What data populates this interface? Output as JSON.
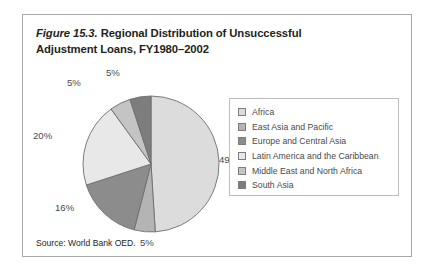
{
  "figure": {
    "number": "Figure 15.3.",
    "caption": " Regional Distribution of Unsuccessful Adjustment Loans, FY1980–2002",
    "full_title": "Figure 15.3. Regional Distribution of Unsuccessful Adjustment Loans, FY1980–2002",
    "source": "Source: World Bank OED."
  },
  "chart_data": {
    "type": "pie",
    "title": "Figure 15.3. Regional Distribution of Unsuccessful Adjustment Loans, FY1980–2002",
    "xlabel": "",
    "ylabel": "",
    "grid": false,
    "legend_position": "right",
    "start_angle_deg": 0,
    "direction": "clockwise",
    "units": "percent",
    "categories": [
      "Africa",
      "East Asia and Pacific",
      "Europe and Central Asia",
      "Latin America and the Caribbean",
      "Middle East and North Africa",
      "South Asia"
    ],
    "values": [
      49,
      5,
      16,
      20,
      5,
      5
    ],
    "data_labels": [
      "49%",
      "5%",
      "16%",
      "20%",
      "5%",
      "5%"
    ],
    "colors": [
      "#dcdcdc",
      "#b4b4b4",
      "#8c8c8c",
      "#e8e8e8",
      "#c4c4c4",
      "#7d7d7d"
    ],
    "slices": [
      {
        "label": "Africa",
        "value": 49,
        "data_label": "49%",
        "color": "#dcdcdc"
      },
      {
        "label": "East Asia and Pacific",
        "value": 5,
        "data_label": "5%",
        "color": "#b4b4b4"
      },
      {
        "label": "Europe and Central Asia",
        "value": 16,
        "data_label": "16%",
        "color": "#8c8c8c"
      },
      {
        "label": "Latin America and the Caribbean",
        "value": 20,
        "data_label": "20%",
        "color": "#e8e8e8"
      },
      {
        "label": "Middle East and North Africa",
        "value": 5,
        "data_label": "5%",
        "color": "#c4c4c4"
      },
      {
        "label": "South Asia",
        "value": 5,
        "data_label": "5%",
        "color": "#7d7d7d"
      }
    ]
  },
  "labels": {
    "africa_pct": "49%",
    "east_asia_pct": "5%",
    "europe_pct": "16%",
    "latin_america_pct": "20%",
    "middle_east_pct": "5%",
    "south_asia_pct": "5%"
  },
  "legend": {
    "items": [
      {
        "label": "Africa",
        "color": "#dcdcdc"
      },
      {
        "label": "East Asia and Pacific",
        "color": "#b4b4b4"
      },
      {
        "label": "Europe and Central Asia",
        "color": "#8c8c8c"
      },
      {
        "label": "Latin America and the Caribbean",
        "color": "#e8e8e8"
      },
      {
        "label": "Middle East and North Africa",
        "color": "#c4c4c4"
      },
      {
        "label": "South Asia",
        "color": "#7d7d7d"
      }
    ]
  },
  "colors": {
    "frame_border": "#a8a8a8",
    "legend_border": "#bdbdbd",
    "text": "#231f20",
    "label_text": "#4a4a4a",
    "slice_outline": "#6e6e6e",
    "background": "#ffffff"
  }
}
